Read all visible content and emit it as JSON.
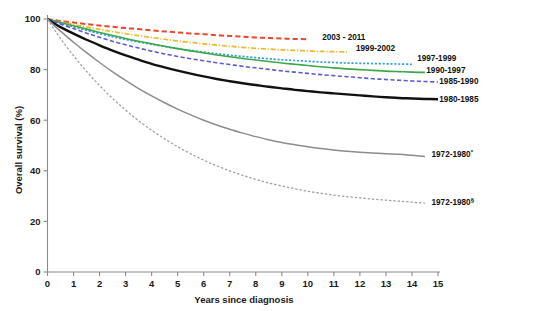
{
  "chart_data": {
    "type": "line",
    "title": "",
    "subtitle": "",
    "xlabel": "Years since diagnosis",
    "ylabel": "Overall survival (%)",
    "xlim": [
      0,
      15
    ],
    "ylim": [
      0,
      100
    ],
    "xticks": [
      0,
      1,
      2,
      3,
      4,
      5,
      6,
      7,
      8,
      9,
      10,
      11,
      12,
      13,
      14,
      15
    ],
    "yticks": [
      0,
      20,
      40,
      60,
      80,
      100
    ],
    "xticklabels": [
      "0",
      "1",
      "2",
      "3",
      "4",
      "5",
      "6",
      "7",
      "8",
      "9",
      "10",
      "11",
      "12",
      "13",
      "14",
      "15"
    ],
    "yticklabels": [
      "0",
      "20",
      "40",
      "60",
      "80",
      "100"
    ],
    "grid": false,
    "legend_position": "right-inline-labels",
    "series": [
      {
        "name": "2003 - 2011",
        "label": "2003 - 2011",
        "superscript": "",
        "color": "#e8492e",
        "dash": "dashed",
        "width": 2.0,
        "label_x": 10.55,
        "label_y": 93.0,
        "x": [
          0,
          0.25,
          0.5,
          1,
          1.5,
          2,
          2.5,
          3,
          3.5,
          4,
          4.5,
          5,
          5.5,
          6,
          6.5,
          7,
          7.5,
          8,
          8.5,
          9,
          9.5,
          10
        ],
        "y": [
          100,
          99.6,
          99.2,
          98.6,
          98.0,
          97.4,
          96.9,
          96.4,
          96.0,
          95.5,
          95.1,
          94.7,
          94.3,
          94.0,
          93.6,
          93.3,
          93.0,
          92.7,
          92.5,
          92.3,
          92.1,
          92.0
        ]
      },
      {
        "name": "1999-2002",
        "label": "1999-2002",
        "superscript": "",
        "color": "#f0b828",
        "dash": "dashdot",
        "width": 1.7,
        "label_x": 11.85,
        "label_y": 88.5,
        "x": [
          0,
          0.25,
          0.5,
          1,
          1.5,
          2,
          2.5,
          3,
          3.5,
          4,
          4.5,
          5,
          5.5,
          6,
          6.5,
          7,
          7.5,
          8,
          8.5,
          9,
          9.5,
          10,
          10.5,
          11,
          11.5
        ],
        "y": [
          100,
          99.4,
          98.8,
          97.8,
          96.8,
          95.9,
          95.0,
          94.2,
          93.4,
          92.7,
          92.0,
          91.3,
          90.7,
          90.2,
          89.7,
          89.2,
          88.8,
          88.4,
          88.1,
          87.8,
          87.6,
          87.4,
          87.2,
          87.1,
          87.0
        ]
      },
      {
        "name": "1997-1999",
        "label": "1997-1999",
        "superscript": "",
        "color": "#3a9fd8",
        "dash": "dotted",
        "width": 1.7,
        "label_x": 14.2,
        "label_y": 84.5,
        "x": [
          0,
          0.25,
          0.5,
          1,
          1.5,
          2,
          2.5,
          3,
          3.5,
          4,
          4.5,
          5,
          5.5,
          6,
          6.5,
          7,
          7.5,
          8,
          8.5,
          9,
          9.5,
          10,
          10.5,
          11,
          11.5,
          12,
          12.5,
          13,
          13.5,
          14
        ],
        "y": [
          100,
          99.2,
          98.4,
          96.9,
          95.5,
          94.2,
          93.0,
          91.9,
          90.9,
          90.0,
          89.1,
          88.3,
          87.6,
          86.9,
          86.3,
          85.7,
          85.2,
          84.7,
          84.3,
          83.9,
          83.6,
          83.3,
          83.0,
          82.8,
          82.6,
          82.5,
          82.4,
          82.3,
          82.2,
          82.1
        ]
      },
      {
        "name": "1990-1997",
        "label": "1990-1997",
        "superscript": "",
        "color": "#3aa84a",
        "dash": "solid",
        "width": 1.6,
        "label_x": 14.55,
        "label_y": 80.0,
        "x": [
          0,
          0.25,
          0.5,
          1,
          1.5,
          2,
          2.5,
          3,
          3.5,
          4,
          4.5,
          5,
          5.5,
          6,
          6.5,
          7,
          7.5,
          8,
          8.5,
          9,
          9.5,
          10,
          10.5,
          11,
          11.5,
          12,
          12.5,
          13,
          13.5,
          14,
          14.5
        ],
        "y": [
          100,
          99.3,
          98.6,
          97.3,
          96.0,
          94.7,
          93.5,
          92.3,
          91.2,
          90.2,
          89.2,
          88.3,
          87.4,
          86.6,
          85.8,
          85.1,
          84.4,
          83.8,
          83.2,
          82.6,
          82.1,
          81.6,
          81.1,
          80.7,
          80.3,
          80.0,
          79.7,
          79.4,
          79.2,
          79.0,
          78.9
        ]
      },
      {
        "name": "1985-1990",
        "label": "1985-1990",
        "superscript": "",
        "color": "#5b5bd6",
        "dash": "dashed",
        "width": 1.6,
        "label_x": 15.05,
        "label_y": 75.5,
        "x": [
          0,
          0.25,
          0.5,
          1,
          1.5,
          2,
          2.5,
          3,
          3.5,
          4,
          4.5,
          5,
          5.5,
          6,
          6.5,
          7,
          7.5,
          8,
          8.5,
          9,
          9.5,
          10,
          10.5,
          11,
          11.5,
          12,
          12.5,
          13,
          13.5,
          14,
          14.5,
          15
        ],
        "y": [
          100,
          99.0,
          98.0,
          96.2,
          94.4,
          92.8,
          91.2,
          89.8,
          88.5,
          87.3,
          86.2,
          85.2,
          84.3,
          83.5,
          82.7,
          82.0,
          81.3,
          80.7,
          80.1,
          79.5,
          79.0,
          78.5,
          78.0,
          77.6,
          77.2,
          76.8,
          76.4,
          76.1,
          75.8,
          75.5,
          75.3,
          75.1
        ]
      },
      {
        "name": "1980-1985",
        "label": "1980-1985",
        "superscript": "",
        "color": "#111111",
        "dash": "solid",
        "width": 2.4,
        "label_x": 15.05,
        "label_y": 68.5,
        "x": [
          0,
          0.25,
          0.5,
          1,
          1.5,
          2,
          2.5,
          3,
          3.5,
          4,
          4.5,
          5,
          5.5,
          6,
          6.5,
          7,
          7.5,
          8,
          8.5,
          9,
          9.5,
          10,
          10.5,
          11,
          11.5,
          12,
          12.5,
          13,
          13.5,
          14,
          14.5,
          15
        ],
        "y": [
          100,
          98.3,
          96.8,
          94.2,
          91.8,
          89.6,
          87.5,
          85.6,
          83.9,
          82.3,
          80.9,
          79.6,
          78.4,
          77.3,
          76.3,
          75.4,
          74.6,
          73.9,
          73.2,
          72.6,
          72.0,
          71.5,
          71.0,
          70.6,
          70.2,
          69.8,
          69.4,
          69.1,
          68.8,
          68.6,
          68.4,
          68.3
        ]
      },
      {
        "name": "1972-1980*",
        "label": "1972-1980",
        "superscript": "*",
        "color": "#8c8c8c",
        "dash": "solid",
        "width": 1.5,
        "label_x": 14.75,
        "label_y": 46.5,
        "x": [
          0,
          0.25,
          0.5,
          1,
          1.5,
          2,
          2.5,
          3,
          3.5,
          4,
          4.5,
          5,
          5.5,
          6,
          6.5,
          7,
          7.5,
          8,
          8.5,
          9,
          9.5,
          10,
          10.5,
          11,
          11.5,
          12,
          12.5,
          13,
          13.5,
          14,
          14.5
        ],
        "y": [
          100,
          97.5,
          95.2,
          90.8,
          86.7,
          82.8,
          79.1,
          75.7,
          72.5,
          69.6,
          66.9,
          64.4,
          62.1,
          60.0,
          58.1,
          56.4,
          54.9,
          53.5,
          52.3,
          51.2,
          50.3,
          49.5,
          48.8,
          48.2,
          47.7,
          47.3,
          47.0,
          46.7,
          46.5,
          46.1,
          45.7
        ]
      },
      {
        "name": "1972-1980 §",
        "label": "1972-1980",
        "superscript": "§",
        "color": "#a0a0a0",
        "dash": "dashed-fine",
        "width": 1.3,
        "label_x": 14.75,
        "label_y": 27.5,
        "x": [
          0,
          0.25,
          0.5,
          1,
          1.5,
          2,
          2.5,
          3,
          3.5,
          4,
          4.5,
          5,
          5.5,
          6,
          6.5,
          7,
          7.5,
          8,
          8.5,
          9,
          9.5,
          10,
          10.5,
          11,
          11.5,
          12,
          12.5,
          13,
          13.5,
          14,
          14.5
        ],
        "y": [
          100,
          96.0,
          92.3,
          85.5,
          79.3,
          73.7,
          68.6,
          64.0,
          59.8,
          56.0,
          52.6,
          49.5,
          46.7,
          44.2,
          42.0,
          40.0,
          38.2,
          36.6,
          35.2,
          34.0,
          32.9,
          31.9,
          31.1,
          30.4,
          29.8,
          29.3,
          28.8,
          28.4,
          28.0,
          27.6,
          27.2
        ]
      }
    ]
  }
}
